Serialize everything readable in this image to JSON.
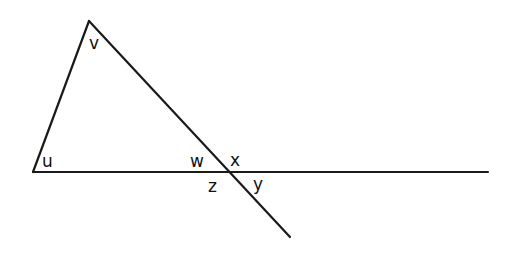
{
  "diagram": {
    "type": "geometry-angles",
    "angle_labels": {
      "v": "v",
      "u": "u",
      "w": "w",
      "x": "x",
      "z": "z",
      "y": "y"
    },
    "colors": {
      "line": "#1a1a1a",
      "background": "#ffffff"
    }
  }
}
